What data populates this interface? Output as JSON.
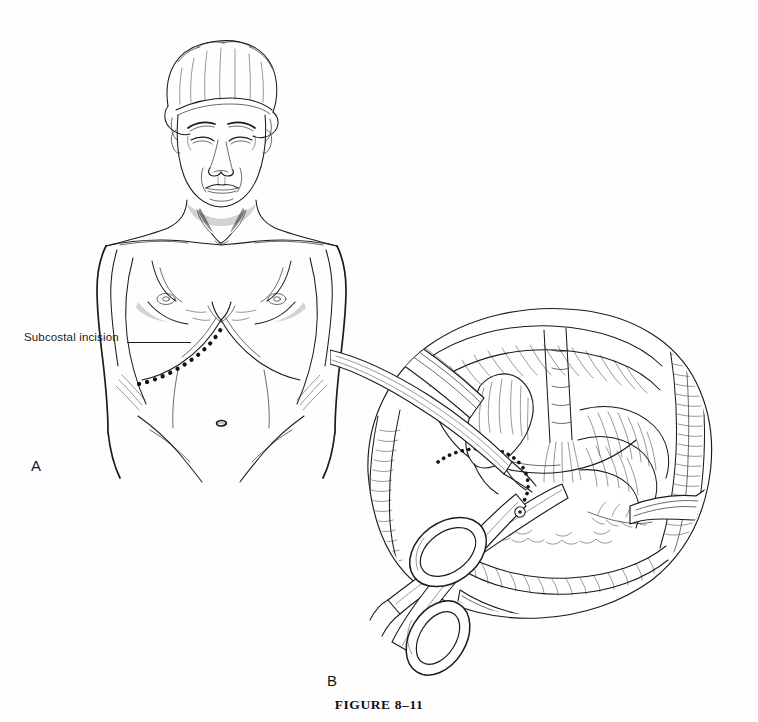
{
  "page": {
    "background_color": "#ffffff",
    "ink_color": "#1b1b1b",
    "running_head": "",
    "type": "medical-textbook-figure"
  },
  "figure": {
    "caption": "FIGURE 8–11",
    "number": "8–11",
    "title_text": "FIGURE 8–11"
  },
  "panels": [
    {
      "letter": "A",
      "name": "patient-anterior-view",
      "description": "Anterior view of patient in surgical cap showing marked subcostal incision",
      "annotations": [
        {
          "label": "Subcostal incision",
          "leader": "horizontal-line",
          "target": "right-upper-abdomen-dotted-line"
        }
      ]
    },
    {
      "letter": "B",
      "name": "operative-field-view",
      "description": "Intraoperative exposure with scissors, retractor blades, and dotted incision line over viscera",
      "annotations": []
    }
  ],
  "labels": {
    "subcostal_incision": "Subcostal incision",
    "panel_a": "A",
    "panel_b": "B"
  },
  "icons": {
    "scissors": "surgical-scissors-icon",
    "retractor": "retractor-blade-icon",
    "dotted_incision": "dotted-incision-line-icon"
  },
  "colors": {
    "ink": "#1b1b1b",
    "page": "#ffffff",
    "dots": "#121212"
  }
}
